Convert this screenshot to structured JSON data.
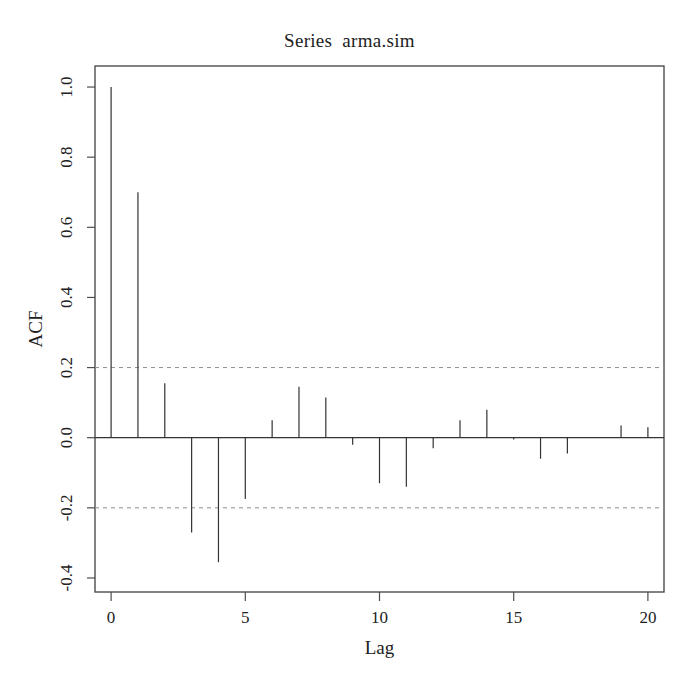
{
  "chart_data": {
    "type": "bar",
    "variant": "acf-stem",
    "title": "Series  arma.sim",
    "xlabel": "Lag",
    "ylabel": "ACF",
    "x": [
      0,
      1,
      2,
      3,
      4,
      5,
      6,
      7,
      8,
      9,
      10,
      11,
      12,
      13,
      14,
      15,
      16,
      17,
      18,
      19,
      20
    ],
    "values": [
      1.0,
      0.7,
      0.155,
      -0.27,
      -0.355,
      -0.175,
      0.05,
      0.145,
      0.115,
      -0.02,
      -0.13,
      -0.14,
      -0.03,
      0.05,
      0.08,
      -0.005,
      -0.06,
      -0.045,
      0.0,
      0.035,
      0.03
    ],
    "xlim": [
      -0.6,
      20.6
    ],
    "ylim": [
      -0.44,
      1.06
    ],
    "xticks": [
      0,
      5,
      10,
      15,
      20
    ],
    "xtick_labels": [
      "0",
      "5",
      "10",
      "15",
      "20"
    ],
    "yticks": [
      -0.4,
      -0.2,
      0.0,
      0.2,
      0.4,
      0.6,
      0.8,
      1.0
    ],
    "ytick_labels": [
      "-0.4",
      "-0.2",
      "0.0",
      "0.2",
      "0.4",
      "0.6",
      "0.8",
      "1.0"
    ],
    "confidence_bands": [
      0.2,
      -0.2
    ],
    "confidence_style": "dashed",
    "zero_line": 0.0,
    "grid": false,
    "legend": null,
    "colors": {
      "background": "#ffffff",
      "frame": "#4d4d4d",
      "spike": "#333333",
      "confidence": "#8c8c8c",
      "text": "#222222"
    }
  }
}
